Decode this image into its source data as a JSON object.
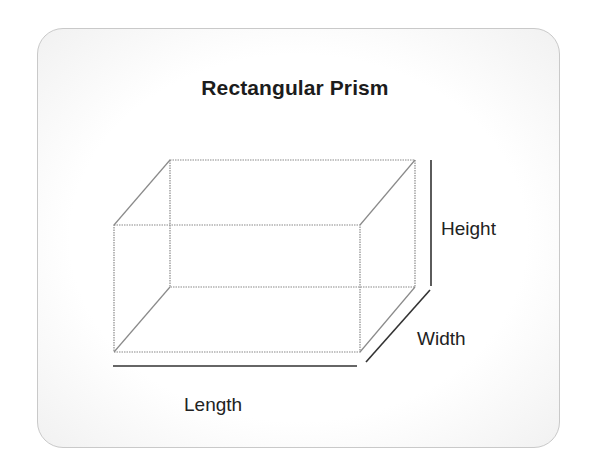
{
  "title": "Rectangular Prism",
  "labels": {
    "height": "Height",
    "width": "Width",
    "length": "Length"
  },
  "colors": {
    "edge": "#8a8a8a",
    "dimension_line": "#333333",
    "text": "#222222"
  }
}
